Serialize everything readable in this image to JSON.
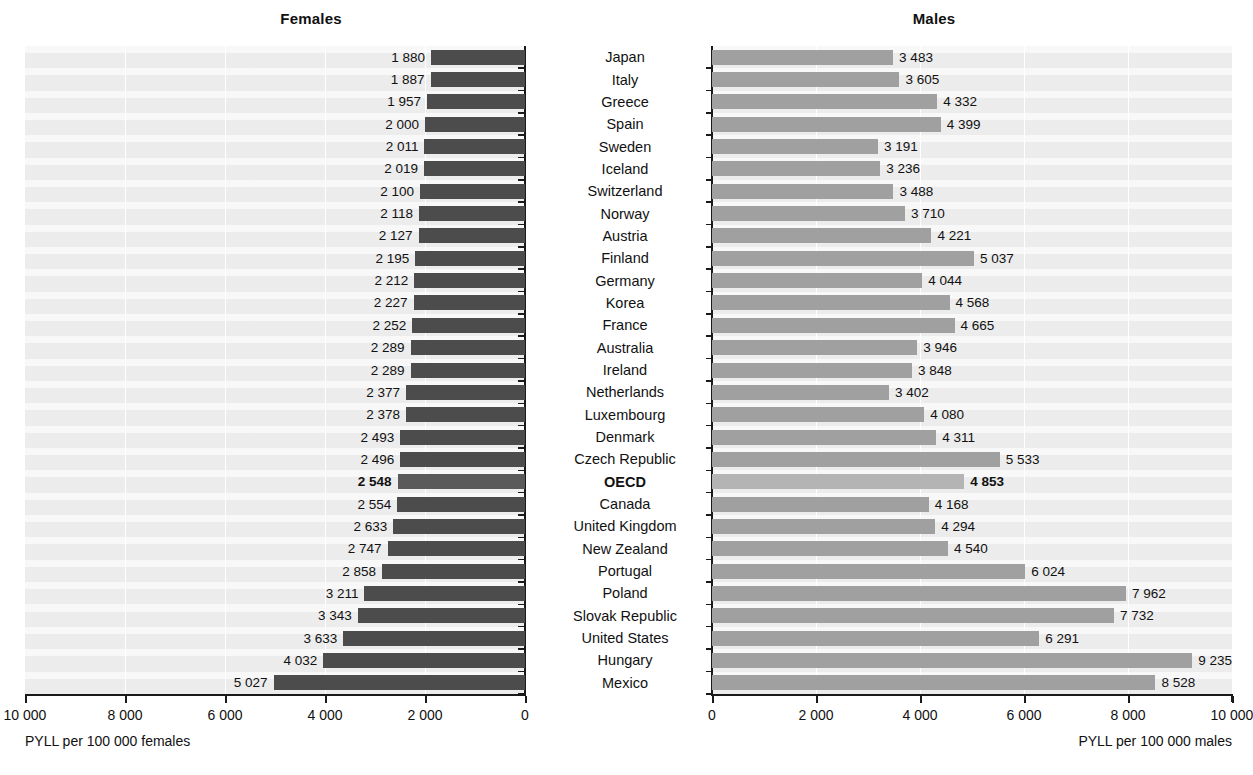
{
  "panels": {
    "females": {
      "title": "Females",
      "axis_caption": "PYLL per 100 000 females"
    },
    "males": {
      "title": "Males",
      "axis_caption": "PYLL per 100 000 males"
    }
  },
  "clipped_header": "",
  "axis": {
    "female_ticks": [
      "10 000",
      "8 000",
      "6 000",
      "4 000",
      "2 000",
      "0"
    ],
    "male_ticks": [
      "0",
      "2 000",
      "4 000",
      "6 000",
      "8 000",
      "10 000"
    ],
    "min": 0,
    "max": 10000,
    "step": 2000
  },
  "colors": {
    "female_bar": "#4c4c4c",
    "male_bar": "#a0a0a0",
    "oecd_female_bar": "#5a5a5a",
    "oecd_male_bar": "#b4b4b4",
    "plot_background": "#f0f0f0",
    "gridline": "#ffffff",
    "axis": "#1a1a1a",
    "text": "#111111"
  },
  "chart_data": {
    "type": "bar",
    "orientation": "horizontal",
    "layout": "butterfly-back-to-back",
    "xlabel": "PYLL per 100 000 population",
    "ylabel": "",
    "xlim": [
      0,
      10000
    ],
    "grid": true,
    "grid_axis": "x",
    "legend": false,
    "categories": [
      "Japan",
      "Italy",
      "Greece",
      "Spain",
      "Sweden",
      "Iceland",
      "Switzerland",
      "Norway",
      "Austria",
      "Finland",
      "Germany",
      "Korea",
      "France",
      "Australia",
      "Ireland",
      "Netherlands",
      "Luxembourg",
      "Denmark",
      "Czech Republic",
      "OECD",
      "Canada",
      "United Kingdom",
      "New Zealand",
      "Portugal",
      "Poland",
      "Slovak Republic",
      "United States",
      "Hungary",
      "Mexico"
    ],
    "highlight_category": "OECD",
    "series": [
      {
        "name": "Females",
        "unit": "PYLL per 100 000 females",
        "direction": "left",
        "values": [
          1880,
          1887,
          1957,
          2000,
          2011,
          2019,
          2100,
          2118,
          2127,
          2195,
          2212,
          2227,
          2252,
          2289,
          2289,
          2377,
          2378,
          2493,
          2496,
          2548,
          2554,
          2633,
          2747,
          2858,
          3211,
          3343,
          3633,
          4032,
          5027
        ],
        "labels": [
          "1 880",
          "1 887",
          "1 957",
          "2 000",
          "2 011",
          "2 019",
          "2 100",
          "2 118",
          "2 127",
          "2 195",
          "2 212",
          "2 227",
          "2 252",
          "2 289",
          "2 289",
          "2 377",
          "2 378",
          "2 493",
          "2 496",
          "2 548",
          "2 554",
          "2 633",
          "2 747",
          "2 858",
          "3 211",
          "3 343",
          "3 633",
          "4 032",
          "5 027"
        ]
      },
      {
        "name": "Males",
        "unit": "PYLL per 100 000 males",
        "direction": "right",
        "values": [
          3483,
          3605,
          4332,
          4399,
          3191,
          3236,
          3488,
          3710,
          4221,
          5037,
          4044,
          4568,
          4665,
          3946,
          3848,
          3402,
          4080,
          4311,
          5533,
          4853,
          4168,
          4294,
          4540,
          6024,
          7962,
          7732,
          6291,
          9235,
          8528
        ],
        "labels": [
          "3 483",
          "3 605",
          "4 332",
          "4 399",
          "3 191",
          "3 236",
          "3 488",
          "3 710",
          "4 221",
          "5 037",
          "4 044",
          "4 568",
          "4 665",
          "3 946",
          "3 848",
          "3 402",
          "4 080",
          "4 311",
          "5 533",
          "4 853",
          "4 168",
          "4 294",
          "4 540",
          "6 024",
          "7 962",
          "7 732",
          "6 291",
          "9 235",
          "8 528"
        ]
      }
    ]
  }
}
